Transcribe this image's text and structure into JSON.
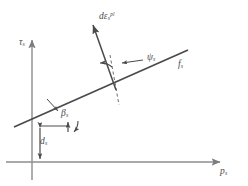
{
  "figure": {
    "type": "yield-surface-diagram",
    "background_color": "#ffffff",
    "line_color": "#4a4a4a",
    "axis_color": "#8c8c8c",
    "label_color": "#4a4a4a",
    "width": 248,
    "height": 186
  },
  "axes": {
    "vertical": {
      "label_base": "τ",
      "label_sub": "s",
      "x": 32,
      "y_top": 38,
      "y_bottom": 180,
      "arrow": "up"
    },
    "horizontal": {
      "label_base": "p",
      "label_sub": "s",
      "y": 162,
      "x_left": 6,
      "x_right": 222,
      "arrow": "right"
    }
  },
  "yield_surface": {
    "name": "yield-surface-line",
    "label_base": "f",
    "label_sub": "s",
    "x1": 14,
    "y1": 127,
    "x2": 188,
    "y2": 50
  },
  "strain_increment": {
    "name": "plastic-strain-increment-vector",
    "label_base": "dε",
    "label_sub": "s",
    "label_sup": "pl",
    "tail_x": 115,
    "tail_y": 85,
    "tip_x": 92,
    "tip_y": 23
  },
  "normal_reference": {
    "name": "normal-reference-dashed-line",
    "style": "dashed",
    "x1": 112,
    "y1": 57,
    "x2": 118,
    "y2": 103
  },
  "angles": [
    {
      "name": "dilation-angle",
      "label_base": "ψ",
      "label_sub": "s",
      "description": "dilation angle between strain increment and reference normal"
    },
    {
      "name": "friction-angle",
      "label_base": "β",
      "label_sub": "s",
      "description": "friction angle of the yield surface with the p axis"
    }
  ],
  "cohesion": {
    "name": "cohesion-dimension",
    "label_base": "d",
    "label_sub": "s",
    "description": "cohesion intercept measured on the tau axis",
    "x": 40,
    "y_top": 125,
    "y_bottom": 162
  }
}
